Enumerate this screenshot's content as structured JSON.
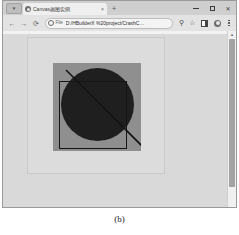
{
  "window": {
    "tab_menu_icon": "caret-down-icon",
    "tabs": [
      {
        "title": "Canvas画图实例",
        "favicon": "page-favicon",
        "close_label": "×",
        "active": true
      }
    ],
    "new_tab_label": "+",
    "controls": {
      "minimize_label": "–",
      "maximize_label": "□",
      "close_label": "✕"
    }
  },
  "toolbar": {
    "back_label": "←",
    "forward_label": "→",
    "reload_label": "⟳",
    "omnibox": {
      "scheme_icon": "file-info-icon",
      "scheme_label": "File",
      "url": "D:/HBuilderX %20project/CrashC…"
    },
    "zoom_icon_label": "⚲",
    "star_icon_label": "☆",
    "side_panel_icon": "side-panel-icon",
    "profile_icon": "profile-avatar-icon",
    "menu_icon": "three-dot-menu-icon"
  },
  "page": {
    "background_color": "#d9d9d9",
    "canvas": {
      "frame_background": "#dcdcdc",
      "frame_border_color": "#c9c9c9",
      "surface_color": "#8f8f8f",
      "shapes": [
        {
          "name": "filled-circle",
          "color": "#1f1f1f"
        },
        {
          "name": "square-outline",
          "color": "#151515"
        },
        {
          "name": "diagonal-line",
          "color": "#141414"
        }
      ]
    }
  },
  "scrollbar": {
    "up_arrow_label": "▴",
    "thumb_color": "#a3a3a3"
  },
  "figure": {
    "caption": "(b)"
  }
}
